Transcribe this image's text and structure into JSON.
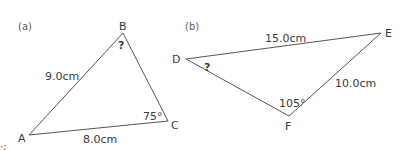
{
  "figure": {
    "triangles": [
      {
        "part_label": "(a)",
        "vertices": {
          "A": "A",
          "B": "B",
          "C": "C"
        },
        "sides": {
          "AB": "9.0cm",
          "AC": "8.0cm"
        },
        "angles": {
          "B": "?",
          "C": "75°"
        }
      },
      {
        "part_label": "(b)",
        "vertices": {
          "D": "D",
          "E": "E",
          "F": "F"
        },
        "sides": {
          "DE": "15.0cm",
          "EF": "10.0cm"
        },
        "angles": {
          "D": "?",
          "F": "105°"
        }
      }
    ],
    "stray_mark": "·:"
  }
}
